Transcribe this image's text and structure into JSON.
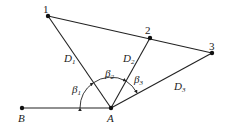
{
  "diagram": {
    "points": {
      "p1": {
        "label": "1",
        "x": 48,
        "y": 16
      },
      "p2": {
        "label": "2",
        "x": 150,
        "y": 38
      },
      "p3": {
        "label": "3",
        "x": 212,
        "y": 53
      },
      "A": {
        "label": "A",
        "x": 111,
        "y": 108
      },
      "B": {
        "label": "B",
        "x": 22,
        "y": 108
      }
    },
    "distances": {
      "D1": {
        "main": "D",
        "sub": "1"
      },
      "D2": {
        "main": "D",
        "sub": "2"
      },
      "D3": {
        "main": "D",
        "sub": "3"
      }
    },
    "angles": {
      "b1": {
        "main": "β",
        "sub": "1"
      },
      "b2": {
        "main": "β",
        "sub": "2"
      },
      "b3": {
        "main": "β",
        "sub": "3"
      }
    },
    "colors": {
      "line": "#222222",
      "point": "#111111"
    }
  }
}
